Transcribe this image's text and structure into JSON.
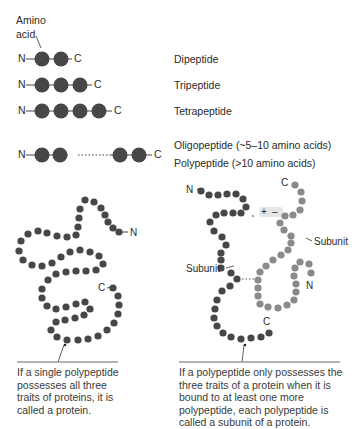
{
  "labels": {
    "amino_acid": "Amino acid",
    "amino_line1": "Amino",
    "amino_line2": "acid",
    "n_terminus": "N",
    "c_terminus": "C",
    "plus": "+",
    "minus": "–"
  },
  "peptide_types": [
    {
      "name": "Dipeptide",
      "beads": 2
    },
    {
      "name": "Tripeptide",
      "beads": 3
    },
    {
      "name": "Tetrapeptide",
      "beads": 4
    },
    {
      "name": "Oligopeptide (~5–10 amino acids)",
      "beads": "2 ... 2"
    },
    {
      "name": "Polypeptide (>10 amino acids)",
      "beads": "2 ... 2"
    }
  ],
  "subunit_labels": [
    "Subunit",
    "Subunit"
  ],
  "captions": {
    "left": "If a single polypeptide possesses all three traits of proteins, it is called a protein.",
    "right": "If a polypeptide only possesses the three traits of a protein when it is bound to at least one more polypeptide, each polypeptide is called a subunit of a protein."
  },
  "colors": {
    "dark_bead": "#474747",
    "light_bead": "#8a8a8a",
    "caption_rule": "#999999",
    "ionic_highlight": "#e6e6e6"
  }
}
